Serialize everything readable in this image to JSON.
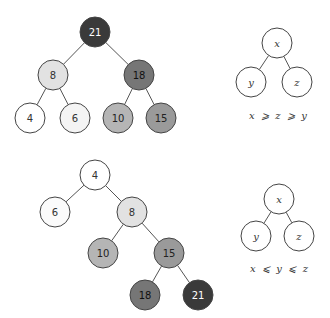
{
  "diagrams": {
    "max_heap": {
      "nodes": [
        {
          "id": "n21",
          "label": "21",
          "x": 95,
          "y": 32,
          "fill": "#3a3a3a",
          "text": "#ffffff"
        },
        {
          "id": "n8",
          "label": "8",
          "x": 53,
          "y": 75,
          "fill": "#e2e2e2",
          "text": "#333333"
        },
        {
          "id": "n18",
          "label": "18",
          "x": 139,
          "y": 75,
          "fill": "#767676",
          "text": "#111111"
        },
        {
          "id": "n4",
          "label": "4",
          "x": 30,
          "y": 118,
          "fill": "#ffffff",
          "text": "#333333"
        },
        {
          "id": "n6",
          "label": "6",
          "x": 75,
          "y": 118,
          "fill": "#f4f4f4",
          "text": "#333333"
        },
        {
          "id": "n10",
          "label": "10",
          "x": 118,
          "y": 118,
          "fill": "#b5b5b5",
          "text": "#222222"
        },
        {
          "id": "n15",
          "label": "15",
          "x": 161,
          "y": 118,
          "fill": "#9a9a9a",
          "text": "#222222"
        }
      ],
      "edges": [
        [
          "n21",
          "n8"
        ],
        [
          "n21",
          "n18"
        ],
        [
          "n8",
          "n4"
        ],
        [
          "n8",
          "n6"
        ],
        [
          "n18",
          "n10"
        ],
        [
          "n18",
          "n15"
        ]
      ]
    },
    "max_heap_schema": {
      "nodes": [
        {
          "id": "sx",
          "label": "x",
          "x": 277,
          "y": 43
        },
        {
          "id": "sy",
          "label": "y",
          "x": 251,
          "y": 82
        },
        {
          "id": "sz",
          "label": "z",
          "x": 297,
          "y": 82
        }
      ],
      "edges": [
        [
          "sx",
          "sy"
        ],
        [
          "sx",
          "sz"
        ]
      ],
      "relation": {
        "text": "x  ⩾  z  ⩾  y",
        "x": 278,
        "y": 119
      }
    },
    "min_heap": {
      "nodes": [
        {
          "id": "m4",
          "label": "4",
          "x": 95,
          "y": 175,
          "fill": "#ffffff",
          "text": "#333333"
        },
        {
          "id": "m6",
          "label": "6",
          "x": 55,
          "y": 212,
          "fill": "#fbfbfb",
          "text": "#333333"
        },
        {
          "id": "m8",
          "label": "8",
          "x": 132,
          "y": 212,
          "fill": "#e2e2e2",
          "text": "#333333"
        },
        {
          "id": "m10",
          "label": "10",
          "x": 103,
          "y": 253,
          "fill": "#b5b5b5",
          "text": "#222222"
        },
        {
          "id": "m15",
          "label": "15",
          "x": 169,
          "y": 253,
          "fill": "#9a9a9a",
          "text": "#222222"
        },
        {
          "id": "m18",
          "label": "18",
          "x": 145,
          "y": 295,
          "fill": "#767676",
          "text": "#111111"
        },
        {
          "id": "m21",
          "label": "21",
          "x": 198,
          "y": 295,
          "fill": "#3a3a3a",
          "text": "#ffffff"
        }
      ],
      "edges": [
        [
          "m4",
          "m6"
        ],
        [
          "m4",
          "m8"
        ],
        [
          "m8",
          "m10"
        ],
        [
          "m8",
          "m15"
        ],
        [
          "m15",
          "m18"
        ],
        [
          "m15",
          "m21"
        ]
      ]
    },
    "min_heap_schema": {
      "nodes": [
        {
          "id": "tx",
          "label": "x",
          "x": 279,
          "y": 199
        },
        {
          "id": "ty",
          "label": "y",
          "x": 256,
          "y": 236
        },
        {
          "id": "tz",
          "label": "z",
          "x": 299,
          "y": 236
        }
      ],
      "edges": [
        [
          "tx",
          "ty"
        ],
        [
          "tx",
          "tz"
        ]
      ],
      "relation": {
        "text": "x  ⩽  y  ⩽  z",
        "x": 279,
        "y": 272
      }
    }
  },
  "style": {
    "node_radius": 15,
    "schema_radius": 15,
    "edge_color": "#555555",
    "stroke_color": "#444444"
  }
}
